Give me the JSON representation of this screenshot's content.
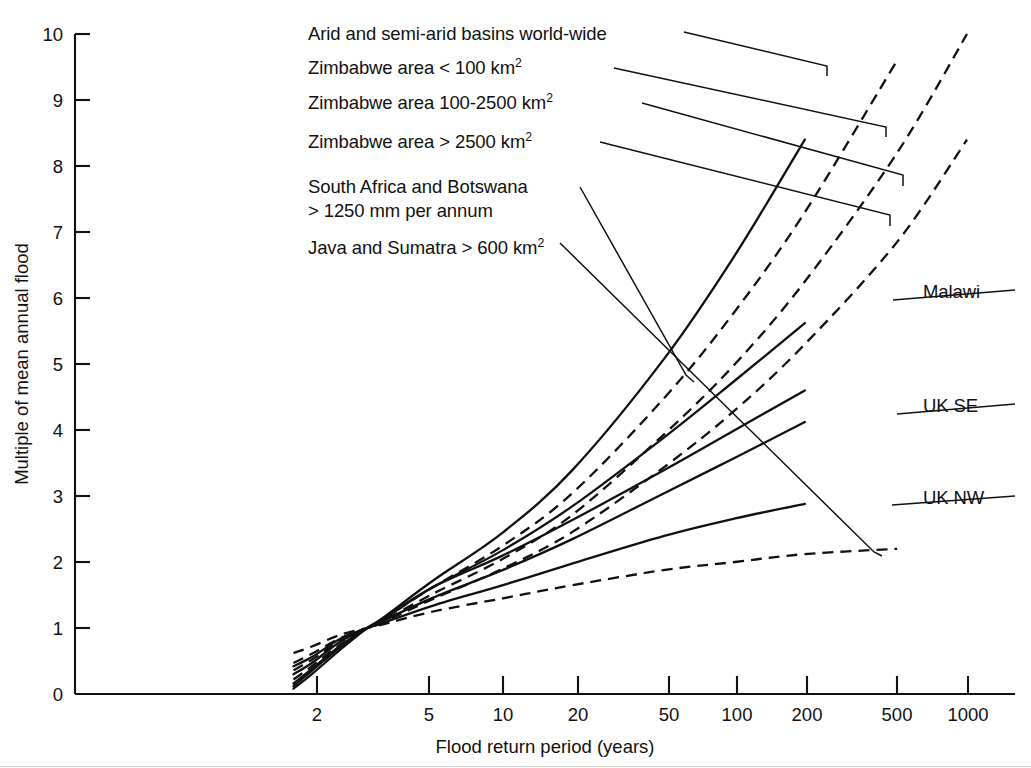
{
  "chart_data": {
    "type": "line",
    "title": "",
    "xlabel": "Flood return period (years)",
    "ylabel": "Multiple of mean annual flood",
    "x_scale": "log",
    "y_scale": "linear",
    "xlim": [
      1.05,
      1400
    ],
    "ylim": [
      0,
      10
    ],
    "xticks": [
      2,
      5,
      10,
      20,
      50,
      100,
      200,
      500,
      1000
    ],
    "xtick_labels": [
      "2",
      "5",
      "10",
      "20",
      "50",
      "100",
      "200",
      "500",
      "1000"
    ],
    "yticks": [
      0,
      1,
      2,
      3,
      4,
      5,
      6,
      7,
      8,
      9,
      10
    ],
    "ytick_labels": [
      "0",
      "1",
      "2",
      "3",
      "4",
      "5",
      "6",
      "7",
      "8",
      "9",
      "10"
    ],
    "grid": false,
    "legend_position": "annotated-leader-lines",
    "x_values": [
      1.25,
      1.5,
      2,
      2.6,
      3,
      5,
      10,
      20,
      50,
      100,
      200,
      500,
      1000
    ],
    "series": [
      {
        "name": "Arid and semi-arid basins world-wide",
        "style": "solid",
        "label_side": "left",
        "values": [
          0.12,
          0.35,
          0.72,
          1.0,
          1.14,
          1.72,
          2.45,
          3.4,
          5.1,
          6.65,
          8.4,
          null,
          null
        ]
      },
      {
        "name": "Zimbabwe area < 100 km2",
        "style": "dashed",
        "label_side": "left",
        "values": [
          0.22,
          0.42,
          0.76,
          1.0,
          1.12,
          1.62,
          2.25,
          3.05,
          4.5,
          5.8,
          7.3,
          9.6,
          null
        ]
      },
      {
        "name": "Zimbabwe area 100-2500 km2",
        "style": "dashed",
        "label_side": "left",
        "values": [
          0.36,
          0.52,
          0.81,
          1.0,
          1.1,
          1.52,
          2.05,
          2.72,
          3.95,
          5.0,
          6.25,
          8.2,
          10.0
        ]
      },
      {
        "name": "Zimbabwe area > 2500 km2",
        "style": "dashed",
        "label_side": "left",
        "values": [
          0.47,
          0.61,
          0.85,
          1.0,
          1.08,
          1.44,
          1.9,
          2.46,
          3.45,
          4.3,
          5.3,
          6.85,
          8.4
        ]
      },
      {
        "name": "South Africa and Botswana > 1250 mm per annum",
        "style": "solid",
        "label_side": "left",
        "values": [
          0.08,
          0.3,
          0.68,
          1.0,
          1.13,
          1.62,
          2.1,
          2.64,
          3.4,
          4.0,
          4.6,
          null,
          null
        ]
      },
      {
        "name": "Java and Sumatra > 600 km2",
        "style": "dashed",
        "label_side": "left",
        "values": [
          0.62,
          0.72,
          0.9,
          1.0,
          1.05,
          1.25,
          1.45,
          1.65,
          1.88,
          2.0,
          2.12,
          2.2,
          null
        ]
      },
      {
        "name": "Malawi",
        "style": "solid",
        "label_side": "right",
        "values": [
          0.16,
          0.38,
          0.74,
          1.0,
          1.12,
          1.62,
          2.18,
          2.85,
          3.9,
          4.75,
          5.62,
          null,
          null
        ]
      },
      {
        "name": "UK SE",
        "style": "solid",
        "label_side": "right",
        "values": [
          0.3,
          0.47,
          0.8,
          1.0,
          1.1,
          1.46,
          1.88,
          2.35,
          3.05,
          3.58,
          4.12,
          null,
          null
        ]
      },
      {
        "name": "UK NW",
        "style": "solid",
        "label_side": "right",
        "values": [
          0.42,
          0.56,
          0.84,
          1.0,
          1.07,
          1.34,
          1.65,
          1.98,
          2.4,
          2.66,
          2.88,
          null,
          null
        ]
      }
    ]
  },
  "axes": {
    "y_title": "Multiple of mean annual flood",
    "x_title": "Flood return period (years)",
    "ytick_labels": [
      "10",
      "9",
      "8",
      "7",
      "6",
      "5",
      "4",
      "3",
      "2",
      "1",
      "0"
    ],
    "xtick_labels": [
      "2",
      "5",
      "10",
      "20",
      "50",
      "100",
      "200",
      "500",
      "1000"
    ]
  },
  "annotations": {
    "left": [
      {
        "id": "arid",
        "line1": "Arid and semi-arid basins world-wide",
        "line2": ""
      },
      {
        "id": "zim-lt100",
        "line1": "Zimbabwe area < 100 km",
        "sup": "2",
        "line2": ""
      },
      {
        "id": "zim-100-2500",
        "line1": "Zimbabwe area 100-2500 km",
        "sup": "2",
        "line2": ""
      },
      {
        "id": "zim-gt2500",
        "line1": "Zimbabwe area > 2500 km",
        "sup": "2",
        "line2": ""
      },
      {
        "id": "south-africa",
        "line1": "South Africa and Botswana",
        "line2": "> 1250 mm per annum"
      },
      {
        "id": "java",
        "line1": "Java and Sumatra > 600 km",
        "sup": "2",
        "line2": ""
      }
    ],
    "right": [
      {
        "id": "malawi",
        "label": "Malawi"
      },
      {
        "id": "uk-se",
        "label": "UK SE"
      },
      {
        "id": "uk-nw",
        "label": "UK NW"
      }
    ]
  },
  "colors": {
    "ink": "#111111",
    "background": "#ffffff"
  }
}
